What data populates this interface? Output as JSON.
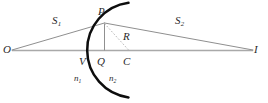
{
  "figure": {
    "type": "optics-refraction-diagram",
    "colors": {
      "axis": "#a8a8a8",
      "ray": "#8c8c8c",
      "surface": "#111111",
      "dashed": "#b4b4b4",
      "label": "#2a2a2a",
      "background": "#ffffff"
    },
    "points": [
      {
        "key": "O",
        "label": "O",
        "x": 12,
        "y": 50,
        "desc": "object-point"
      },
      {
        "key": "P",
        "label": "P",
        "x": 104,
        "y": 23,
        "desc": "point-on-surface"
      },
      {
        "key": "V",
        "label": "V",
        "x": 87,
        "y": 50,
        "desc": "vertex"
      },
      {
        "key": "Q",
        "label": "Q",
        "x": 104,
        "y": 50,
        "desc": "foot-of-perpendicular"
      },
      {
        "key": "C",
        "label": "C",
        "x": 129,
        "y": 50,
        "desc": "center-of-curvature"
      },
      {
        "key": "I",
        "label": "I",
        "x": 253,
        "y": 50,
        "desc": "image-point"
      }
    ],
    "segments": [
      {
        "key": "S1",
        "label": "S",
        "sub": "1",
        "desc": "object-distance"
      },
      {
        "key": "S2",
        "label": "S",
        "sub": "2",
        "desc": "image-distance"
      },
      {
        "key": "R",
        "label": "R",
        "sub": "",
        "desc": "radius-of-curvature"
      }
    ],
    "media": [
      {
        "key": "n1",
        "label": "n",
        "sub": "1",
        "desc": "refractive-index-left"
      },
      {
        "key": "n2",
        "label": "n",
        "sub": "2",
        "desc": "refractive-index-right"
      }
    ],
    "labels": {
      "O": "O",
      "P": "P",
      "V": "V",
      "Q": "Q",
      "C": "C",
      "I": "I",
      "S1_base": "S",
      "S1_sub": "1",
      "S2_base": "S",
      "S2_sub": "2",
      "R": "R",
      "n1_base": "n",
      "n1_sub": "1",
      "n2_base": "n",
      "n2_sub": "2"
    }
  }
}
